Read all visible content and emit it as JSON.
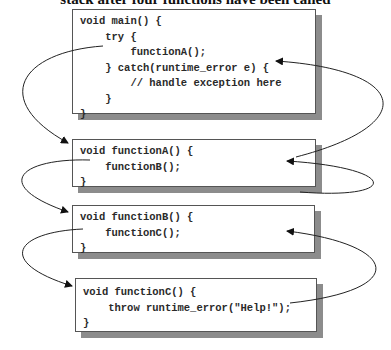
{
  "heading": "stack after four functions have been called",
  "boxes": {
    "main": {
      "lines": [
        "void main() {",
        "    try {",
        "        functionA();",
        "    } catch(runtime_error e) {",
        "        // handle exception here",
        "    }",
        "}"
      ]
    },
    "functionA": {
      "lines": [
        "void functionA() {",
        "    functionB();",
        "}"
      ]
    },
    "functionB": {
      "lines": [
        "void functionB() {",
        "    functionC();",
        "}"
      ]
    },
    "functionC": {
      "lines": [
        "void functionC() {",
        "    throw runtime_error(\"Help!\");",
        "}"
      ]
    }
  },
  "arrows": [
    {
      "from": "main.functionA()",
      "to": "functionA",
      "direction": "call"
    },
    {
      "from": "functionA.functionB()",
      "to": "functionB",
      "direction": "call"
    },
    {
      "from": "functionB.functionC()",
      "to": "functionC",
      "direction": "call"
    },
    {
      "from": "functionC.throw",
      "to": "functionB",
      "direction": "unwind"
    },
    {
      "from": "functionB",
      "to": "functionA",
      "direction": "unwind"
    },
    {
      "from": "functionA",
      "to": "main.catch",
      "direction": "unwind"
    }
  ]
}
